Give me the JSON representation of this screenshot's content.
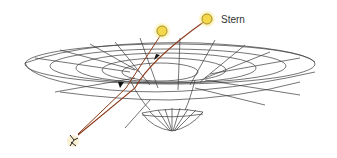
{
  "diagram": {
    "type": "gravitational-lensing-illustration",
    "labels": {
      "star": "Stern"
    },
    "elements": {
      "real_star": {
        "x": 207,
        "y": 19,
        "color": "#f5d84a"
      },
      "apparent_star": {
        "x": 162,
        "y": 32,
        "color": "#f5d84a"
      },
      "observer": {
        "x": 73,
        "y": 141
      },
      "light_path_color": "#8b3a1a",
      "grid_color": "#333333"
    }
  }
}
